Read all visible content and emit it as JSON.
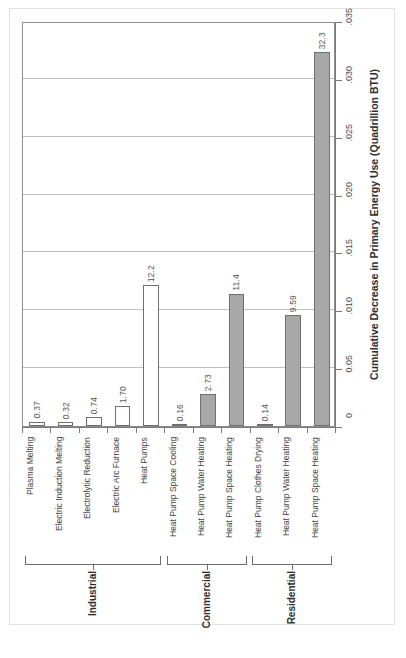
{
  "chart_data": {
    "type": "bar",
    "title": "",
    "orientation": "vertical-bars-rotated-labels",
    "xlabel": "",
    "ylabel": "Cumulative Decrease in Primary Energy Use (Quadrillion BTU)",
    "ylim": [
      0,
      0.035
    ],
    "grid": true,
    "legend": null,
    "value_label_note": "Bar value labels are printed in units of 0.001 Quadrillion BTU (i.e. label 32.3 == 0.0323 on the axis).",
    "tick_labels": [
      ".035",
      ".030",
      ".025",
      ".020",
      ".015",
      ".010",
      "0.05",
      "0"
    ],
    "tick_values": [
      0.035,
      0.03,
      0.025,
      0.02,
      0.015,
      0.01,
      0.005,
      0
    ],
    "categories": [
      "Plasma Melting",
      "Electric Induction Melting",
      "Electrolytic Reduction",
      "Electric Arc Furnace",
      "Heat Pumps",
      "Heat Pump Space Cooling",
      "Heat Pump Water Heating",
      "Heat Pump Space Heating",
      "Heat Pump Clothes Drying",
      "Heat Pump Water Heating",
      "Heat Pump Space Heating"
    ],
    "value_labels": [
      "0.37",
      "0.32",
      "0.74",
      "1.70",
      "12.2",
      "0.16",
      "2.73",
      "11.4",
      "0.14",
      "9.59",
      "32.3"
    ],
    "values": [
      0.00037,
      0.00032,
      0.00074,
      0.0017,
      0.0122,
      0.00016,
      0.00273,
      0.0114,
      0.00014,
      0.00959,
      0.0323
    ],
    "bar_styles": [
      "open",
      "open",
      "open",
      "open",
      "open",
      "filled",
      "filled",
      "filled",
      "filled",
      "filled",
      "filled"
    ],
    "groups": [
      {
        "label": "Industrial",
        "first": 0,
        "last": 4
      },
      {
        "label": "Commercial",
        "first": 5,
        "last": 7
      },
      {
        "label": "Residential",
        "first": 8,
        "last": 10
      }
    ],
    "colors": {
      "bar_open_fill": "#ffffff",
      "bar_filled_fill": "#a8a8a8",
      "bar_stroke": "#6f6f6f",
      "gridline": "#bfbfbf",
      "axis": "#7a7a7a",
      "plot_border": "#8d8d8d",
      "text": "#2e2e2e"
    }
  }
}
